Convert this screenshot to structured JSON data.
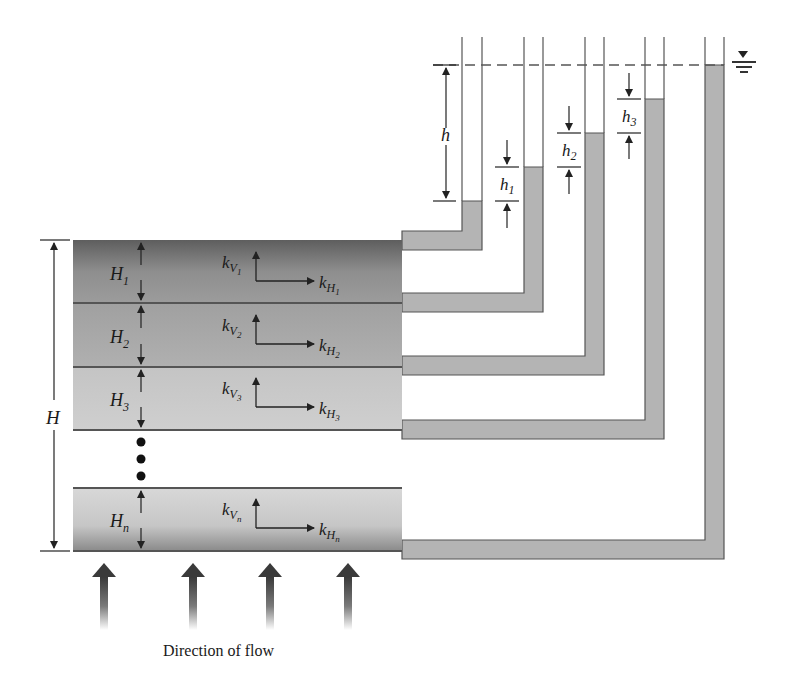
{
  "figure": {
    "caption": "Direction of flow",
    "total_thickness_label": "H",
    "head_loss_label": "h",
    "layers": [
      {
        "thickness": "H",
        "thickness_sub": "1",
        "kv": "k",
        "kv_sub": "V",
        "kv_subsub": "1",
        "kh": "k",
        "kh_sub": "H",
        "kh_subsub": "1"
      },
      {
        "thickness": "H",
        "thickness_sub": "2",
        "kv": "k",
        "kv_sub": "V",
        "kv_subsub": "2",
        "kh": "k",
        "kh_sub": "H",
        "kh_subsub": "2"
      },
      {
        "thickness": "H",
        "thickness_sub": "3",
        "kv": "k",
        "kv_sub": "V",
        "kv_subsub": "3",
        "kh": "k",
        "kh_sub": "H",
        "kh_subsub": "3"
      },
      {
        "thickness": "H",
        "thickness_sub": "n",
        "kv": "k",
        "kv_sub": "V",
        "kv_subsub": "n",
        "kh": "k",
        "kh_sub": "H",
        "kh_subsub": "n"
      }
    ],
    "piezometer_head_labels": [
      {
        "label": "h",
        "sub": "1"
      },
      {
        "label": "h",
        "sub": "2"
      },
      {
        "label": "h",
        "sub": "3"
      }
    ],
    "water_table_symbol": "▼",
    "colors": {
      "pipe_fill": "#b4b4b4",
      "line": "#555555",
      "layer_dark": "#6e6e6e",
      "layer_mid": "#a9a9a9",
      "layer_light": "#c8c8c8"
    }
  }
}
